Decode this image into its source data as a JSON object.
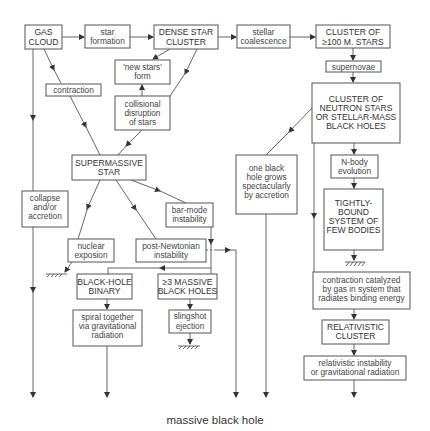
{
  "caption": "massive black hole",
  "nodes": {
    "gas_cloud": [
      "GAS",
      "CLOUD"
    ],
    "star_formation": [
      "star",
      "formation"
    ],
    "dense_star_cluster": [
      "DENSE STAR",
      "CLUSTER"
    ],
    "stellar_coalescence": [
      "stellar",
      "coalescence"
    ],
    "cluster_100": [
      "CLUSTER OF",
      "≥100 M. STARS"
    ],
    "new_stars": [
      "'new stars'",
      "form"
    ],
    "contraction": [
      "contraction"
    ],
    "collisional": [
      "collisional",
      "disruption",
      "of stars"
    ],
    "supernovae": [
      "supernovae"
    ],
    "neutron_cluster": [
      "CLUSTER OF",
      "NEUTRON STARS",
      "OR STELLAR-MASS",
      "BLACK HOLES"
    ],
    "supermassive_star": [
      "SUPERMASSIVE",
      "STAR"
    ],
    "one_black_hole": [
      "one black",
      "hole grows",
      "spectacularly",
      "by accretion"
    ],
    "n_body": [
      "N-body",
      "evolution"
    ],
    "collapse": [
      "collapse",
      "and/or",
      "accretion"
    ],
    "bar_mode": [
      "bar-mode",
      "instability"
    ],
    "tightly_bound": [
      "TIGHTLY-",
      "BOUND",
      "SYSTEM OF",
      "FEW BODIES"
    ],
    "nuclear": [
      "nuclear",
      "exposion"
    ],
    "post_newtonian": [
      "post-Newtonian",
      "instability"
    ],
    "bh_binary": [
      "BLACK-HOLE",
      "BINARY"
    ],
    "massive_3": [
      "≥3 MASSIVE",
      "BLACK HOLES"
    ],
    "contraction_catalyzed": [
      "contraction catalyzed",
      "by gas in system that",
      "radiates binding energy"
    ],
    "spiral": [
      "spiral together",
      "via gravitational",
      "radiation"
    ],
    "slingshot": [
      "slingshot",
      "ejection"
    ],
    "relativistic_cluster": [
      "RELATIVISTIC",
      "CLUSTER"
    ],
    "relativistic_instability": [
      "relativistic instability",
      "or gravitational radiation"
    ]
  }
}
